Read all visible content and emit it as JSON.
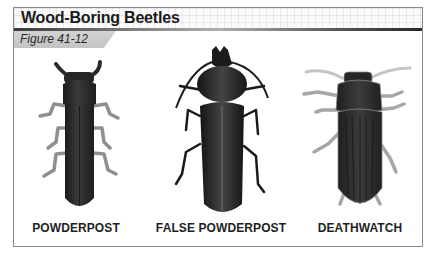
{
  "figure": {
    "title": "Wood-Boring Beetles",
    "label": "Figure 41-12"
  },
  "beetles": [
    {
      "name": "POWDERPOST",
      "icon": "powderpost-beetle-illustration"
    },
    {
      "name": "FALSE POWDERPOST",
      "icon": "false-powderpost-beetle-illustration"
    },
    {
      "name": "DEATHWATCH",
      "icon": "deathwatch-beetle-illustration"
    }
  ],
  "colors": {
    "body_dark": "#2b2b2b",
    "leg_gray": "#8f8f8f",
    "antenna_light": "#c4c4c4",
    "frame_border": "#8a8a8a",
    "tab_gray": "#c8c8c8"
  }
}
